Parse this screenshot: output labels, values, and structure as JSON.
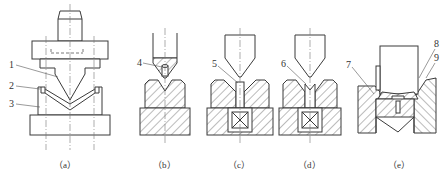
{
  "figure": {
    "panels": [
      {
        "id": "a",
        "caption": "（a）",
        "callouts": [
          {
            "num": "1"
          },
          {
            "num": "2"
          },
          {
            "num": "3"
          }
        ]
      },
      {
        "id": "b",
        "caption": "（b）",
        "callouts": [
          {
            "num": "4"
          }
        ]
      },
      {
        "id": "c",
        "caption": "（c）",
        "callouts": [
          {
            "num": "5"
          }
        ]
      },
      {
        "id": "d",
        "caption": "（d）",
        "callouts": [
          {
            "num": "6"
          }
        ]
      },
      {
        "id": "e",
        "caption": "（e）",
        "callouts": [
          {
            "num": "7"
          },
          {
            "num": "8"
          },
          {
            "num": "9"
          }
        ]
      }
    ]
  }
}
